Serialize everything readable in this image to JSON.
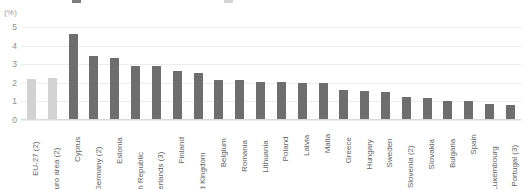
{
  "chart_data": {
    "type": "bar",
    "title": "",
    "unit_label": "(%)",
    "xlabel": "",
    "ylabel": "",
    "ylim": [
      0,
      5
    ],
    "yticks": [
      5,
      4,
      3,
      2,
      1,
      0
    ],
    "grid": true,
    "legend_position": "top",
    "categories": [
      "EU-27 (2)",
      "Euro area (2)",
      "Cyprus",
      "Germany (2)",
      "Estonia",
      "Czech Republic",
      "Netherlands (3)",
      "Finland",
      "United Kingdom",
      "Belgium",
      "Romania",
      "Lithuania",
      "Poland",
      "Latvia",
      "Malta",
      "Greece",
      "Hungary",
      "Sweden",
      "Slovenia (2)",
      "Slovakia",
      "Bulgaria",
      "Spain",
      "Luxembourg",
      "Portugal (3)"
    ],
    "values": [
      2.2,
      2.25,
      4.6,
      3.4,
      3.3,
      2.9,
      2.9,
      2.6,
      2.5,
      2.1,
      2.1,
      2.0,
      2.0,
      1.95,
      1.95,
      1.6,
      1.5,
      1.45,
      1.2,
      1.15,
      1.0,
      1.0,
      0.8,
      0.75
    ],
    "highlight_indices": [
      0,
      1
    ],
    "colors": {
      "bar": "#6e6e6e",
      "bar_aggregate": "#d2d2d2",
      "gridline": "#ededed",
      "axis": "#d9d9d9",
      "tick_text": "#8f8f8f",
      "category_text": "#5f5f5f",
      "unit_text": "#9b9b9b"
    }
  }
}
